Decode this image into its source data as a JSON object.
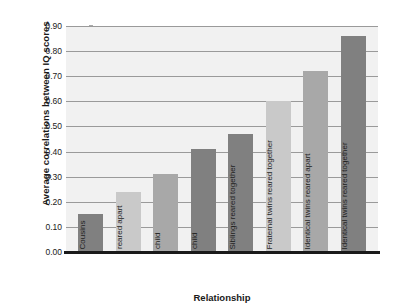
{
  "top_caption": "",
  "chart_data": {
    "type": "bar",
    "title": "",
    "xlabel": "Relationship",
    "ylabel": "Average correlations between IQ scores",
    "ylim": [
      0.0,
      0.9
    ],
    "ytick_labels": [
      "0.90",
      "0.80",
      "0.70",
      "0.60",
      "0.50",
      "0.40",
      "0.30",
      "0.20",
      "0.10",
      "0.00"
    ],
    "ytick_values": [
      0.9,
      0.8,
      0.7,
      0.6,
      0.5,
      0.4,
      0.3,
      0.2,
      0.1,
      0.0
    ],
    "grid": true,
    "legend": "none",
    "categories": [
      "Cousins",
      "Siblings reared apart",
      "Foster parent/ child",
      "Biological parent/ child",
      "Siblings reared together",
      "Fraternal twins reared together",
      "Identical twins reared apart",
      "Identical twins reared together"
    ],
    "values": [
      0.15,
      0.24,
      0.31,
      0.41,
      0.47,
      0.6,
      0.72,
      0.86
    ],
    "bars": [
      {
        "label_line1": "Cousins",
        "label_line2": "",
        "value": 0.15,
        "color": "#808080"
      },
      {
        "label_line1": "Siblings",
        "label_line2": "reared apart",
        "value": 0.24,
        "color": "#c9c9c9"
      },
      {
        "label_line1": "Foster parent/",
        "label_line2": "child",
        "value": 0.31,
        "color": "#a8a8a8"
      },
      {
        "label_line1": "Biological parent/",
        "label_line2": "child",
        "value": 0.41,
        "color": "#808080"
      },
      {
        "label_line1": "Siblings reared together",
        "label_line2": "",
        "value": 0.47,
        "color": "#808080"
      },
      {
        "label_line1": "Fraternal twins reared together",
        "label_line2": "",
        "value": 0.6,
        "color": "#c9c9c9"
      },
      {
        "label_line1": "Identical twins reared apart",
        "label_line2": "",
        "value": 0.72,
        "color": "#a8a8a8"
      },
      {
        "label_line1": "Identical twins reared together",
        "label_line2": "",
        "value": 0.86,
        "color": "#808080"
      }
    ],
    "plot_background": "#f1f1f1",
    "gridline_color": "#9a9a9a",
    "axis_color": "#1a1a1a"
  }
}
